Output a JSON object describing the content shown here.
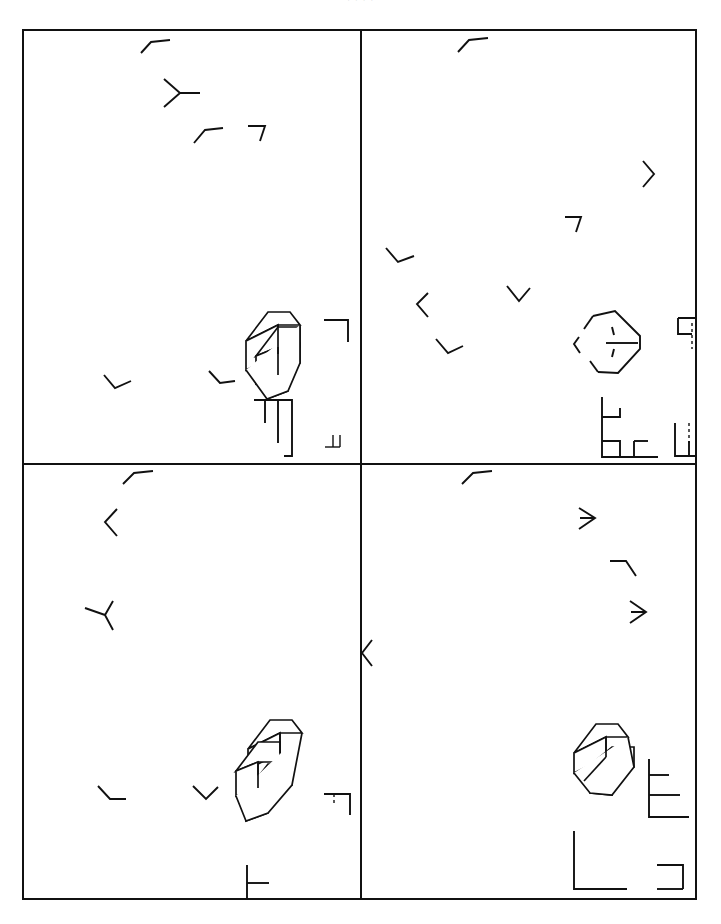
{
  "page": {
    "header_text": "· · · ·",
    "copyright": "Copyright Goodheart-Willcox Co., Inc.",
    "background_color": "#ffffff",
    "ink_color": "#111111",
    "frame": {
      "x": 22,
      "y": 29,
      "width": 675,
      "height": 871,
      "border_px": 2
    },
    "grid": {
      "columns": 2,
      "rows": 2,
      "divider_x": 336,
      "divider_y": 432
    }
  },
  "panels": [
    {
      "id": "panel-top-left",
      "position": "top-left",
      "figure": {
        "name": "impossible-three-bar-block",
        "description": "Impossible figure: three parallel bars forming an interlocking L-block that cannot exist in three dimensions.",
        "style": "solid-outline",
        "x": 240,
        "y": 306,
        "width": 58,
        "height": 66
      },
      "fragments": [
        {
          "name": "caret-mark",
          "glyph": "caret-up-right",
          "x": 143,
          "y": 32
        },
        {
          "name": "y-junction-mark",
          "glyph": "y-junction-right",
          "x": 168,
          "y": 66
        },
        {
          "name": "caret-mark",
          "glyph": "caret-up-right",
          "x": 196,
          "y": 122
        },
        {
          "name": "corner-mark",
          "glyph": "corner-top-right",
          "x": 250,
          "y": 117
        },
        {
          "name": "vee-mark",
          "glyph": "vee-down-right",
          "x": 108,
          "y": 366
        },
        {
          "name": "corner-mark",
          "glyph": "corner-bottom-right",
          "x": 211,
          "y": 367
        }
      ],
      "brackets": [
        {
          "name": "corner-bracket",
          "glyph": "bracket-top-right",
          "x": 322,
          "y": 318,
          "w": 24,
          "h": 22
        },
        {
          "name": "comb-bracket",
          "glyph": "bracket-comb-down",
          "x": 252,
          "y": 398,
          "w": 38,
          "h": 52
        },
        {
          "name": "corner-bracket",
          "glyph": "bracket-bottom-right-dash",
          "x": 323,
          "y": 438,
          "w": 18,
          "h": 14
        }
      ]
    },
    {
      "id": "panel-top-right",
      "position": "top-right",
      "figure": {
        "name": "impossible-hexagon-outline",
        "description": "Partial hexagonal outline of the impossible block with interior edges reduced to short tick fragments.",
        "style": "open-outline",
        "x": 568,
        "y": 305,
        "width": 58,
        "height": 62
      },
      "fragments": [
        {
          "name": "caret-mark",
          "glyph": "caret-up-right",
          "x": 462,
          "y": 31
        },
        {
          "name": "chevron-mark",
          "glyph": "chevron-right",
          "x": 648,
          "y": 165
        },
        {
          "name": "corner-mark",
          "glyph": "corner-top-right",
          "x": 557,
          "y": 216
        },
        {
          "name": "vee-mark",
          "glyph": "vee-down-right",
          "x": 390,
          "y": 252
        },
        {
          "name": "chevron-mark",
          "glyph": "chevron-left",
          "x": 421,
          "y": 298
        },
        {
          "name": "vee-mark",
          "glyph": "vee-down-right",
          "x": 512,
          "y": 288
        },
        {
          "name": "vee-mark",
          "glyph": "vee-down-right",
          "x": 441,
          "y": 342
        }
      ],
      "brackets": [
        {
          "name": "corner-bracket",
          "glyph": "bracket-top-right-dash",
          "x": 655,
          "y": 316,
          "w": 28,
          "h": 30
        },
        {
          "name": "step-bracket",
          "glyph": "bracket-step-left",
          "x": 578,
          "y": 395,
          "w": 56,
          "h": 60
        },
        {
          "name": "corner-bracket",
          "glyph": "bracket-bottom-right-dash",
          "x": 652,
          "y": 421,
          "w": 30,
          "h": 32
        }
      ]
    },
    {
      "id": "panel-bottom-left",
      "position": "bottom-left",
      "figure": {
        "name": "impossible-three-bar-block-shaded",
        "description": "Impossible figure variant with stepped interlocking bars, solid outline.",
        "style": "solid-outline",
        "x": 238,
        "y": 752,
        "width": 58,
        "height": 62
      },
      "fragments": [
        {
          "name": "caret-mark",
          "glyph": "caret-up-right",
          "x": 128,
          "y": 475
        },
        {
          "name": "chevron-mark",
          "glyph": "chevron-left",
          "x": 104,
          "y": 517
        },
        {
          "name": "y-junction-mark",
          "glyph": "y-junction-left",
          "x": 97,
          "y": 605
        },
        {
          "name": "vee-mark",
          "glyph": "vee-up-right",
          "x": 107,
          "y": 793
        },
        {
          "name": "corner-mark",
          "glyph": "corner-bottom-right",
          "x": 202,
          "y": 792
        }
      ],
      "brackets": [
        {
          "name": "corner-bracket",
          "glyph": "bracket-top-right-dash",
          "x": 322,
          "y": 762,
          "w": 26,
          "h": 22
        },
        {
          "name": "step-bracket",
          "glyph": "bracket-step-right",
          "x": 245,
          "y": 834,
          "w": 58,
          "h": 58
        },
        {
          "name": "corner-bracket",
          "glyph": "bracket-bottom-right",
          "x": 322,
          "y": 870,
          "w": 24,
          "h": 22
        }
      ]
    },
    {
      "id": "panel-bottom-right",
      "position": "bottom-right",
      "figure": {
        "name": "impossible-block-open",
        "description": "Impossible block drawn as an outer hexagon with a single inner notched bar.",
        "style": "solid-outline",
        "x": 572,
        "y": 752,
        "width": 58,
        "height": 62
      },
      "fragments": [
        {
          "name": "caret-mark",
          "glyph": "caret-up-right",
          "x": 467,
          "y": 475
        },
        {
          "name": "arrow-mark",
          "glyph": "arrow-right",
          "x": 586,
          "y": 518
        },
        {
          "name": "corner-mark",
          "glyph": "corner-top-left",
          "x": 617,
          "y": 568
        },
        {
          "name": "arrow-mark",
          "glyph": "arrow-right",
          "x": 637,
          "y": 611
        },
        {
          "name": "chevron-mark",
          "glyph": "chevron-left",
          "x": 368,
          "y": 652
        }
      ],
      "brackets": [
        {
          "name": "comb-bracket",
          "glyph": "bracket-comb-right",
          "x": 654,
          "y": 758,
          "w": 34,
          "h": 50
        },
        {
          "name": "corner-bracket",
          "glyph": "bracket-bottom-left-large",
          "x": 578,
          "y": 830,
          "w": 48,
          "h": 58
        },
        {
          "name": "corner-bracket",
          "glyph": "bracket-bottom-right",
          "x": 655,
          "y": 862,
          "w": 26,
          "h": 26
        }
      ]
    }
  ]
}
